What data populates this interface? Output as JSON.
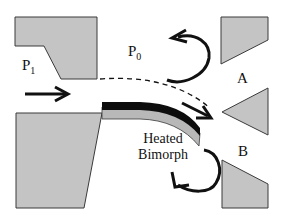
{
  "diagram": {
    "colors": {
      "block_fill": "#c4c4c4",
      "block_stroke": "#3a3a3a",
      "bimorph_top": "#0d0d0d",
      "bimorph_bottom": "#b8b8b8",
      "arrow": "#111111"
    },
    "labels": {
      "p1_main": "P",
      "p1_sub": "1",
      "p0_main": "P",
      "p0_sub": "0",
      "outlet_a": "A",
      "outlet_b": "B",
      "bimorph_line1": "Heated",
      "bimorph_line2": "Bimorph"
    },
    "elements": [
      {
        "id": "upper-left-block",
        "type": "solid wall"
      },
      {
        "id": "lower-left-block",
        "type": "solid wall"
      },
      {
        "id": "bimorph",
        "type": "bilayer cantilever",
        "state": "deflected downward"
      },
      {
        "id": "undeflected-path",
        "type": "dashed line"
      },
      {
        "id": "inlet-arrow",
        "type": "flow arrow"
      },
      {
        "id": "jet-arrow",
        "type": "flow arrow",
        "direction": "toward outlet B"
      },
      {
        "id": "recirculation-arrow-top",
        "type": "curved arrow"
      },
      {
        "id": "recirculation-arrow-bottom",
        "type": "curved arrow"
      },
      {
        "id": "outlet-a-upper-wall",
        "type": "solid wall"
      },
      {
        "id": "splitter-wedge",
        "type": "solid wall"
      },
      {
        "id": "outlet-b-lower-wall",
        "type": "solid wall"
      }
    ]
  }
}
